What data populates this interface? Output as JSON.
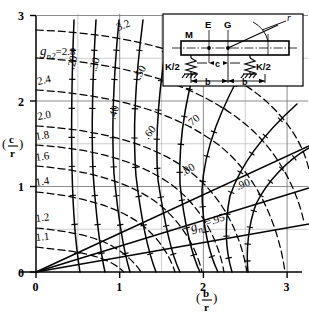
{
  "figure": {
    "type": "nomograph",
    "axis_x_label_num": "b",
    "axis_x_label_den": "r",
    "axis_y_label_num": "c",
    "axis_y_label_den": "r"
  },
  "axes": {
    "x_ticks": [
      "0",
      "1",
      "2",
      "3"
    ],
    "x_values": [
      0,
      1,
      2,
      3
    ],
    "y_ticks": [
      "0",
      "1",
      "2",
      "3"
    ],
    "y_values": [
      0,
      1,
      2,
      3
    ],
    "xlim": [
      0,
      3.2
    ],
    "ylim": [
      0,
      3.1
    ],
    "grid_major_step": 1,
    "grid_minor_step": 0.5,
    "grid": true
  },
  "inset": {
    "label_mass": "M",
    "label_e": "E",
    "label_g": "G",
    "label_r": "r",
    "label_c": "c",
    "label_b_left": "b",
    "label_b_right": "b",
    "label_k_left": "K/2",
    "label_k_right": "K/2"
  },
  "chart_data": {
    "type": "line",
    "title": "",
    "xlabel": "(b/r)",
    "ylabel": "(c/r)",
    "xlim": [
      0,
      3.2
    ],
    "ylim": [
      0,
      3.1
    ],
    "grid": true,
    "legend": "none",
    "series_groups": [
      {
        "name": "g_n2",
        "style": "dashed",
        "label_prefix": "g",
        "label_sub": "n2",
        "label_eq": "=",
        "labels": [
          "1.1",
          "1.2",
          "1.4",
          "1.6",
          "1.8",
          "2.0",
          "2.4",
          "2.8",
          "3.2"
        ],
        "values": [
          1.1,
          1.2,
          1.4,
          1.6,
          1.8,
          2.0,
          2.4,
          2.8,
          3.2
        ],
        "anchor_label": "2.8",
        "description": "dashed family of constant frequency-ratio curves"
      },
      {
        "name": "g_n1",
        "style": "solid",
        "label_prefix": "g",
        "label_sub": "n1",
        "label_eq": "=",
        "labels": [
          ".20",
          ".30",
          ".40",
          ".50",
          ".60",
          ".70",
          ".80",
          ".90",
          ".95"
        ],
        "values": [
          0.2,
          0.3,
          0.4,
          0.5,
          0.6,
          0.7,
          0.8,
          0.9,
          0.95
        ],
        "anchor_label": ".95",
        "description": "solid family of constant frequency-ratio curves"
      }
    ]
  },
  "curves": {
    "gn2": [
      {
        "label": "1.1",
        "k": 1.1,
        "path": "M 36 247 C 62 250 84 252 100 258 C 112 262 120 268 124 272"
      },
      {
        "label": "1.2",
        "k": 1.2,
        "path": "M 36 228 C 68 231 94 236 112 246 C 126 254 136 264 141 272"
      },
      {
        "label": "1.4",
        "k": 1.4,
        "path": "M 36 192 C 80 196 114 206 138 222 C 158 236 170 256 175 272"
      },
      {
        "label": "1.6",
        "k": 1.6,
        "path": "M 36 166 C 88 170 128 182 156 202 C 180 220 196 246 202 272"
      },
      {
        "label": "1.8",
        "k": 1.8,
        "path": "M 36 145 C 96 149 140 162 172 185 C 200 206 218 238 224 272"
      },
      {
        "label": "2.0",
        "k": 2.0,
        "path": "M 36 126 C 102 130 152 144 188 170 C 220 194 240 230 247 272"
      },
      {
        "label": "2.4",
        "k": 2.4,
        "path": "M 36 90 C 118 95 178 114 220 146 C 256 175 278 222 285 272"
      },
      {
        "label": "2.8",
        "k": 2.8,
        "path": "M 36 58 C 130 63 198 86 244 123 C 276 149 296 186 304 222"
      },
      {
        "label": "3.2",
        "k": 3.2,
        "path": "M 36 30 C 140 34 212 58 260 96 C 288 119 304 146 309 170"
      }
    ],
    "gn1": [
      {
        "label": ".20",
        "k": 0.2,
        "path": "M 74 20 C 72 70 71 120 72 170 C 73 212 76 248 80 272"
      },
      {
        "label": ".30",
        "k": 0.3,
        "path": "M 96 20 C 93 70 91 122 93 172 C 96 214 100 250 105 272"
      },
      {
        "label": ".40",
        "k": 0.4,
        "path": "M 119 20 C 114 72 111 124 114 174 C 118 216 124 252 130 272"
      },
      {
        "label": ".50",
        "k": 0.5,
        "path": "M 143 20 C 136 74 132 126 136 176 C 141 218 149 254 156 272"
      },
      {
        "label": ".60",
        "k": 0.6,
        "path": "M 170 22 C 160 78 154 130 158 180 C 164 220 172 256 180 272"
      },
      {
        "label": ".70",
        "k": 0.7,
        "path": "M 205 34 C 188 86 178 134 180 184 C 184 222 192 256 200 272"
      },
      {
        "label": ".80",
        "k": 0.8,
        "path": "M 247 62 C 222 106 204 148 202 190 C 202 226 210 256 218 272"
      },
      {
        "label": ".90",
        "k": 0.9,
        "path": "M 297 104 C 268 130 242 160 230 196 C 224 226 226 252 232 272"
      },
      {
        "label": ".95",
        "k": 0.95,
        "path": "M 309 148 C 288 160 268 180 256 204 C 248 226 246 252 248 272"
      }
    ],
    "radial_solid": [
      {
        "path": "M 36 272 L 309 146"
      },
      {
        "path": "M 36 272 L 309 188"
      },
      {
        "path": "M 36 272 L 309 224"
      }
    ]
  },
  "curve_labels_gn2": [
    {
      "text": "1.1",
      "x": 36,
      "y": 241,
      "rot": -6
    },
    {
      "text": "1.2",
      "x": 36,
      "y": 222,
      "rot": -7
    },
    {
      "text": "1.6",
      "x": 36,
      "y": 161,
      "rot": -8
    },
    {
      "text": "1.4",
      "x": 36,
      "y": 186,
      "rot": -8
    },
    {
      "text": "1.8",
      "x": 36,
      "y": 140,
      "rot": -9
    },
    {
      "text": "2.0",
      "x": 38,
      "y": 120,
      "rot": -10
    },
    {
      "text": "2.4",
      "x": 38,
      "y": 85,
      "rot": -12
    },
    {
      "text": "3.2",
      "x": 118,
      "y": 31,
      "rot": -22
    }
  ],
  "curve_labels_gn1": [
    {
      "text": ".20",
      "x": 74,
      "y": 70,
      "rot": -76
    },
    {
      "text": ".30",
      "x": 96,
      "y": 72,
      "rot": -74
    },
    {
      "text": ".40",
      "x": 115,
      "y": 120,
      "rot": -72
    },
    {
      "text": ".50",
      "x": 140,
      "y": 80,
      "rot": -62
    },
    {
      "text": ".60",
      "x": 148,
      "y": 140,
      "rot": -52
    },
    {
      "text": ".70",
      "x": 190,
      "y": 128,
      "rot": -40
    },
    {
      "text": ".80",
      "x": 184,
      "y": 176,
      "rot": -32
    },
    {
      "text": ".90",
      "x": 238,
      "y": 190,
      "rot": -22
    }
  ],
  "anchor_labels": {
    "gn2": {
      "prefix": "g",
      "sub": "n2",
      "eq": "=",
      "value": "2.8",
      "x": 40,
      "y": 52
    },
    "gn1": {
      "prefix": "g",
      "sub": "n1",
      "eq": "=",
      "value": ".95",
      "x": 190,
      "y": 231
    }
  }
}
